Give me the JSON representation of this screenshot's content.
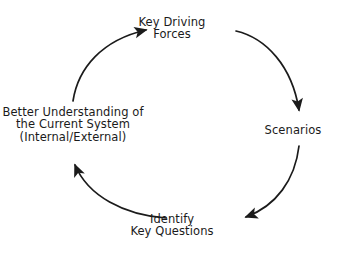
{
  "diagram": {
    "type": "cycle",
    "direction": "clockwise",
    "background_color": "#ffffff",
    "stroke_color": "#1b1b1b",
    "text_color": "#1b1b1b",
    "nodes": [
      {
        "id": "key-driving-forces",
        "position": "top",
        "lines": [
          "Key Driving",
          "Forces"
        ]
      },
      {
        "id": "scenarios",
        "position": "right",
        "lines": [
          "Scenarios"
        ]
      },
      {
        "id": "identify-key-questions",
        "position": "bottom",
        "lines": [
          "Identify",
          "Key Questions"
        ]
      },
      {
        "id": "better-understanding",
        "position": "left",
        "lines": [
          "Better Understanding of",
          "the Current System",
          "(Internal/External)"
        ]
      }
    ],
    "arrows": [
      {
        "id": "arrow-forces-to-scenarios",
        "from": "key-driving-forces",
        "to": "scenarios",
        "direction": "down-right"
      },
      {
        "id": "arrow-scenarios-to-questions",
        "from": "scenarios",
        "to": "identify-key-questions",
        "direction": "down-left"
      },
      {
        "id": "arrow-questions-to-understanding",
        "from": "identify-key-questions",
        "to": "better-understanding",
        "direction": "up-left"
      },
      {
        "id": "arrow-understanding-to-forces",
        "from": "better-understanding",
        "to": "key-driving-forces",
        "direction": "up-right"
      }
    ]
  }
}
